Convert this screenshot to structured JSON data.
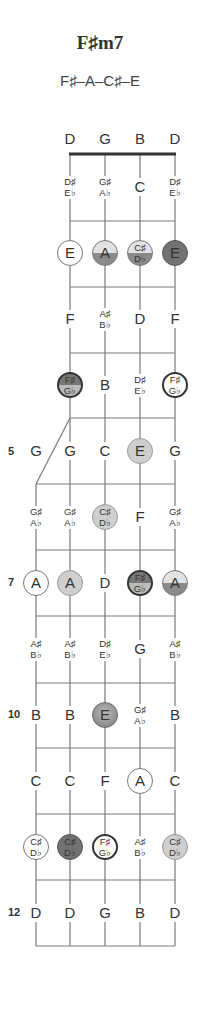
{
  "chord": {
    "name": "F♯m7",
    "notes": "F♯–A–C♯–E"
  },
  "strings": {
    "open_labels": [
      "D",
      "G",
      "B",
      "D"
    ]
  },
  "fret_numbers": [
    {
      "fret": 5,
      "label": "5"
    },
    {
      "fret": 7,
      "label": "7"
    },
    {
      "fret": 10,
      "label": "10"
    },
    {
      "fret": 12,
      "label": "12"
    }
  ],
  "colors": {
    "line": "#7a7a7a",
    "nut": "#333333",
    "light_dot": "#cfcfcf",
    "dark_dot": "#727272"
  },
  "frets": [
    {
      "fret": 1,
      "cells": [
        {
          "s": 1,
          "t": "acc",
          "a": "D♯",
          "b": "E♭"
        },
        {
          "s": 2,
          "t": "acc",
          "a": "G♯",
          "b": "A♭"
        },
        {
          "s": 3,
          "t": "nat",
          "n": "C"
        },
        {
          "s": 4,
          "t": "acc",
          "a": "D♯",
          "b": "E♭"
        }
      ]
    },
    {
      "fret": 2,
      "cells": [
        {
          "s": 1,
          "t": "nat",
          "n": "E",
          "dot": "white"
        },
        {
          "s": 2,
          "t": "nat",
          "n": "A",
          "dot": "half"
        },
        {
          "s": 3,
          "t": "acc",
          "a": "C♯",
          "b": "D♭",
          "dot": "half"
        },
        {
          "s": 4,
          "t": "nat",
          "n": "E",
          "dot": "dark"
        }
      ]
    },
    {
      "fret": 3,
      "cells": [
        {
          "s": 1,
          "t": "nat",
          "n": "F"
        },
        {
          "s": 2,
          "t": "acc",
          "a": "A♯",
          "b": "B♭"
        },
        {
          "s": 3,
          "t": "nat",
          "n": "D"
        },
        {
          "s": 4,
          "t": "nat",
          "n": "F"
        }
      ]
    },
    {
      "fret": 4,
      "cells": [
        {
          "s": 1,
          "t": "acc",
          "a": "F♯",
          "b": "G♭",
          "dot": "darkhalf"
        },
        {
          "s": 2,
          "t": "nat",
          "n": "B"
        },
        {
          "s": 3,
          "t": "acc",
          "a": "D♯",
          "b": "E♭"
        },
        {
          "s": 4,
          "t": "acc",
          "a": "F♯",
          "b": "G♭",
          "dot": "ring"
        }
      ]
    },
    {
      "fret": 5,
      "cells": [
        {
          "s": 0,
          "t": "nat",
          "n": "G"
        },
        {
          "s": 1,
          "t": "nat",
          "n": "G"
        },
        {
          "s": 2,
          "t": "nat",
          "n": "C"
        },
        {
          "s": 3,
          "t": "nat",
          "n": "E",
          "dot": "light"
        },
        {
          "s": 4,
          "t": "nat",
          "n": "G"
        }
      ]
    },
    {
      "fret": 6,
      "cells": [
        {
          "s": 0,
          "t": "acc",
          "a": "G♯",
          "b": "A♭"
        },
        {
          "s": 1,
          "t": "acc",
          "a": "G♯",
          "b": "A♭"
        },
        {
          "s": 2,
          "t": "acc",
          "a": "C♯",
          "b": "D♭",
          "dot": "light"
        },
        {
          "s": 3,
          "t": "nat",
          "n": "F"
        },
        {
          "s": 4,
          "t": "acc",
          "a": "G♯",
          "b": "A♭"
        }
      ]
    },
    {
      "fret": 7,
      "cells": [
        {
          "s": 0,
          "t": "nat",
          "n": "A",
          "dot": "white"
        },
        {
          "s": 1,
          "t": "nat",
          "n": "A",
          "dot": "light"
        },
        {
          "s": 2,
          "t": "nat",
          "n": "D"
        },
        {
          "s": 3,
          "t": "acc",
          "a": "F♯",
          "b": "G♭",
          "dot": "darkhalf"
        },
        {
          "s": 4,
          "t": "nat",
          "n": "A",
          "dot": "half"
        }
      ]
    },
    {
      "fret": 8,
      "cells": [
        {
          "s": 0,
          "t": "acc",
          "a": "A♯",
          "b": "B♭"
        },
        {
          "s": 1,
          "t": "acc",
          "a": "A♯",
          "b": "B♭"
        },
        {
          "s": 2,
          "t": "acc",
          "a": "D♯",
          "b": "E♭"
        },
        {
          "s": 3,
          "t": "nat",
          "n": "G"
        },
        {
          "s": 4,
          "t": "acc",
          "a": "A♯",
          "b": "B♭"
        }
      ]
    },
    {
      "fret": 9,
      "cells": [
        {
          "s": 0,
          "t": "nat",
          "n": "B"
        },
        {
          "s": 1,
          "t": "nat",
          "n": "B"
        },
        {
          "s": 2,
          "t": "nat",
          "n": "E",
          "dot": "grad"
        },
        {
          "s": 3,
          "t": "acc",
          "a": "G♯",
          "b": "A♭"
        },
        {
          "s": 4,
          "t": "nat",
          "n": "B"
        }
      ]
    },
    {
      "fret": 10,
      "cells": [
        {
          "s": 0,
          "t": "nat",
          "n": "C"
        },
        {
          "s": 1,
          "t": "nat",
          "n": "C"
        },
        {
          "s": 2,
          "t": "nat",
          "n": "F"
        },
        {
          "s": 3,
          "t": "nat",
          "n": "A",
          "dot": "white"
        },
        {
          "s": 4,
          "t": "nat",
          "n": "C"
        }
      ]
    },
    {
      "fret": 11,
      "cells": [
        {
          "s": 0,
          "t": "acc",
          "a": "C♯",
          "b": "D♭",
          "dot": "white"
        },
        {
          "s": 1,
          "t": "acc",
          "a": "C♯",
          "b": "D♭",
          "dot": "dark"
        },
        {
          "s": 2,
          "t": "acc",
          "a": "F♯",
          "b": "G♭",
          "dot": "ring"
        },
        {
          "s": 3,
          "t": "acc",
          "a": "A♯",
          "b": "B♭"
        },
        {
          "s": 4,
          "t": "acc",
          "a": "C♯",
          "b": "D♭",
          "dot": "light"
        }
      ]
    },
    {
      "fret": 12,
      "cells": [
        {
          "s": 0,
          "t": "nat",
          "n": "D"
        },
        {
          "s": 1,
          "t": "nat",
          "n": "D"
        },
        {
          "s": 2,
          "t": "nat",
          "n": "G"
        },
        {
          "s": 3,
          "t": "nat",
          "n": "B"
        },
        {
          "s": 4,
          "t": "nat",
          "n": "D"
        }
      ]
    }
  ]
}
